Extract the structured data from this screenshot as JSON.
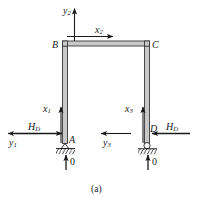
{
  "figure": {
    "caption": "(a)",
    "type": "structural-frame-diagram",
    "nodes": [
      {
        "id": "B",
        "label": "B",
        "x": 58,
        "y": 45,
        "role": "top-left-corner"
      },
      {
        "id": "C",
        "label": "C",
        "x": 155,
        "y": 45,
        "role": "top-right-corner"
      },
      {
        "id": "A",
        "label": "A",
        "x": 66,
        "y": 143,
        "role": "base-left-support"
      },
      {
        "id": "D",
        "label": "D",
        "x": 148,
        "y": 143,
        "role": "base-right-support"
      }
    ],
    "axes": [
      {
        "name": "y2",
        "base": "y",
        "sub": "2",
        "direction": "up",
        "label_x": 63,
        "label_y": 8
      },
      {
        "name": "x2",
        "base": "x",
        "sub": "2",
        "direction": "right",
        "label_x": 100,
        "label_y": 27
      },
      {
        "name": "x1",
        "base": "x",
        "sub": "1",
        "direction": "up",
        "label_x": 42,
        "label_y": 106
      },
      {
        "name": "x3",
        "base": "x",
        "sub": "3",
        "direction": "up",
        "label_x": 125,
        "label_y": 106
      },
      {
        "name": "y1",
        "base": "y",
        "sub": "1",
        "direction": "left",
        "label_x": 9,
        "label_y": 140
      },
      {
        "name": "y3",
        "base": "y",
        "sub": "3",
        "direction": "left",
        "label_x": 102,
        "label_y": 140
      }
    ],
    "forces": [
      {
        "name": "H_D-left",
        "base": "H",
        "sub": "D",
        "direction": "right",
        "label_x": 27,
        "label_y": 124,
        "at_node": "A"
      },
      {
        "name": "H_D-right",
        "base": "H",
        "sub": "D",
        "direction": "left",
        "label_x": 172,
        "label_y": 124,
        "at_node": "D"
      }
    ],
    "reactions": [
      {
        "name": "reaction-A",
        "label": "0",
        "direction": "up",
        "label_x": 72,
        "label_y": 159,
        "at_node": "A"
      },
      {
        "name": "reaction-D",
        "label": "0",
        "direction": "up",
        "label_x": 154,
        "label_y": 159,
        "at_node": "D"
      }
    ],
    "colors": {
      "member_outline": "#3a3a3a",
      "member_fill": "#c8c8c8",
      "ink": "#1a1a1a",
      "background": "#ffffff"
    }
  }
}
